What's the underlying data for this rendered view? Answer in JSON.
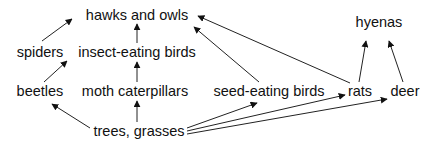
{
  "diagram": {
    "type": "food-web",
    "nodes": [
      {
        "id": "hawks",
        "label": "hawks and owls",
        "x": 137,
        "y": 15
      },
      {
        "id": "hyenas",
        "label": "hyenas",
        "x": 379,
        "y": 22
      },
      {
        "id": "spiders",
        "label": "spiders",
        "x": 40,
        "y": 52
      },
      {
        "id": "insectbirds",
        "label": "insect-eating birds",
        "x": 137,
        "y": 52
      },
      {
        "id": "beetles",
        "label": "beetles",
        "x": 40,
        "y": 91
      },
      {
        "id": "moth",
        "label": "moth caterpillars",
        "x": 135,
        "y": 91
      },
      {
        "id": "seedbirds",
        "label": "seed-eating birds",
        "x": 269,
        "y": 91
      },
      {
        "id": "rats",
        "label": "rats",
        "x": 360,
        "y": 91
      },
      {
        "id": "deer",
        "label": "deer",
        "x": 405,
        "y": 91
      },
      {
        "id": "trees",
        "label": "trees, grasses",
        "x": 139,
        "y": 131
      }
    ],
    "edges": [
      {
        "from": "spiders",
        "to": "hawks"
      },
      {
        "from": "insectbirds",
        "to": "hawks"
      },
      {
        "from": "seedbirds",
        "to": "hawks"
      },
      {
        "from": "rats",
        "to": "hawks"
      },
      {
        "from": "rats",
        "to": "hyenas"
      },
      {
        "from": "deer",
        "to": "hyenas"
      },
      {
        "from": "beetles",
        "to": "spiders"
      },
      {
        "from": "moth",
        "to": "insectbirds"
      },
      {
        "from": "trees",
        "to": "beetles"
      },
      {
        "from": "trees",
        "to": "moth"
      },
      {
        "from": "trees",
        "to": "seedbirds"
      },
      {
        "from": "trees",
        "to": "rats"
      },
      {
        "from": "trees",
        "to": "deer"
      }
    ],
    "colors": {
      "line": "#222222",
      "text": "#111111",
      "background": "#ffffff"
    }
  }
}
